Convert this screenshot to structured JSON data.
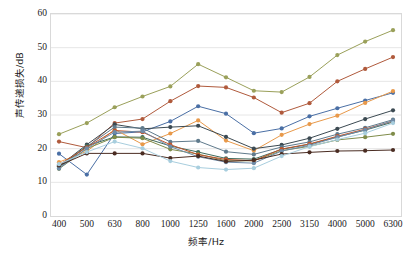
{
  "chart_data": {
    "type": "line",
    "title": "",
    "xlabel": "频率/Hz",
    "ylabel": "声传递损失/dB",
    "categories": [
      "400",
      "500",
      "630",
      "800",
      "1000",
      "1250",
      "1600",
      "2000",
      "2500",
      "3150",
      "4000",
      "5000",
      "6300"
    ],
    "ylim": [
      0,
      60
    ],
    "yticks": [
      0,
      10,
      20,
      30,
      40,
      50,
      60
    ],
    "grid": true,
    "legend": "none",
    "markers": "circle",
    "series": [
      {
        "name": "S1",
        "color": "#9aa05a",
        "values": [
          24.3,
          27.6,
          32.3,
          35.5,
          38.5,
          45.1,
          41.2,
          37.2,
          36.8,
          41.3,
          47.8,
          51.8,
          55.2
        ]
      },
      {
        "name": "S2",
        "color": "#b05a3c",
        "values": [
          22.1,
          20.3,
          27.6,
          28.8,
          34.1,
          38.6,
          38.2,
          35.2,
          30.7,
          33.5,
          40.0,
          43.7,
          47.2
        ]
      },
      {
        "name": "S3",
        "color": "#4a6fa5",
        "values": [
          18.5,
          12.3,
          24.5,
          25.0,
          28.1,
          32.6,
          30.4,
          24.6,
          26.0,
          29.6,
          32.0,
          34.3,
          36.6
        ]
      },
      {
        "name": "S4",
        "color": "#e8994a",
        "values": [
          16.0,
          19.2,
          25.7,
          21.3,
          24.5,
          28.4,
          22.4,
          19.4,
          24.1,
          27.3,
          29.8,
          33.6,
          37.1
        ]
      },
      {
        "name": "S5",
        "color": "#3c4a52",
        "values": [
          14.8,
          21.2,
          27.2,
          25.9,
          26.4,
          26.8,
          23.5,
          20.0,
          21.1,
          23.1,
          25.9,
          28.8,
          31.4
        ]
      },
      {
        "name": "S6",
        "color": "#5f7a8c",
        "values": [
          14.3,
          20.6,
          26.4,
          26.1,
          22.0,
          22.3,
          19.1,
          18.3,
          20.5,
          22.0,
          24.3,
          26.2,
          28.6
        ]
      },
      {
        "name": "S7",
        "color": "#3f6b5c",
        "values": [
          14.6,
          20.8,
          23.5,
          23.4,
          20.8,
          19.0,
          17.1,
          16.9,
          19.8,
          21.3,
          23.5,
          25.5,
          27.9
        ]
      },
      {
        "name": "S8",
        "color": "#7f8c4a",
        "values": [
          14.0,
          20.0,
          23.4,
          23.1,
          19.8,
          18.4,
          16.4,
          16.4,
          19.4,
          20.7,
          22.6,
          23.4,
          24.4
        ]
      },
      {
        "name": "S9",
        "color": "#c0562e",
        "values": [
          15.2,
          20.4,
          25.4,
          24.9,
          21.2,
          18.2,
          16.8,
          16.4,
          19.9,
          21.4,
          23.7,
          25.8,
          28.2
        ]
      },
      {
        "name": "S10",
        "color": "#6e8ba8",
        "values": [
          14.1,
          20.1,
          24.9,
          25.2,
          20.6,
          17.6,
          16.0,
          15.7,
          19.3,
          21.0,
          23.4,
          25.6,
          28.3
        ]
      },
      {
        "name": "S11",
        "color": "#4a2c22",
        "values": [
          15.0,
          18.6,
          18.6,
          18.6,
          17.2,
          17.8,
          16.2,
          16.6,
          18.4,
          18.9,
          19.3,
          19.4,
          19.6
        ]
      },
      {
        "name": "S12",
        "color": "#a8cede",
        "values": [
          15.4,
          19.0,
          22.1,
          20.1,
          16.3,
          14.4,
          13.8,
          14.2,
          17.8,
          20.6,
          22.7,
          24.6,
          27.6
        ]
      }
    ]
  },
  "caption": ""
}
